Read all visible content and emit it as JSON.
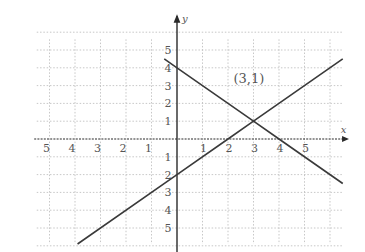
{
  "chart_data": {
    "type": "line",
    "title": "",
    "xlabel": "x",
    "ylabel": "y",
    "xlim": [
      -5.5,
      6.5
    ],
    "ylim": [
      -5.9,
      5.8
    ],
    "grid": true,
    "x_tick_labels": [
      "5",
      "4",
      "3",
      "2",
      "1",
      "1",
      "2",
      "3",
      "4",
      "5"
    ],
    "x_tick_values": [
      -5,
      -4,
      -3,
      -2,
      -1,
      1,
      2,
      3,
      4,
      5
    ],
    "y_tick_labels": [
      "5",
      "4",
      "3",
      "2",
      "1",
      "1",
      "2",
      "3",
      "4",
      "5"
    ],
    "y_tick_values": [
      5,
      4,
      3,
      2,
      1,
      -1,
      -2,
      -3,
      -4,
      -5
    ],
    "series": [
      {
        "name": "y = -x + 4",
        "x": [
          -0.5,
          0,
          3,
          4,
          6.5
        ],
        "y": [
          4.5,
          4,
          1,
          0,
          -2.5
        ]
      },
      {
        "name": "y = x - 2",
        "x": [
          -3.9,
          0,
          2,
          3,
          6.5
        ],
        "y": [
          -5.9,
          -2,
          0,
          1,
          4.5
        ]
      }
    ],
    "annotations": [
      {
        "text": "(3,1)",
        "x": 3,
        "y": 1
      }
    ],
    "intersection": {
      "x": 3,
      "y": 1
    }
  }
}
